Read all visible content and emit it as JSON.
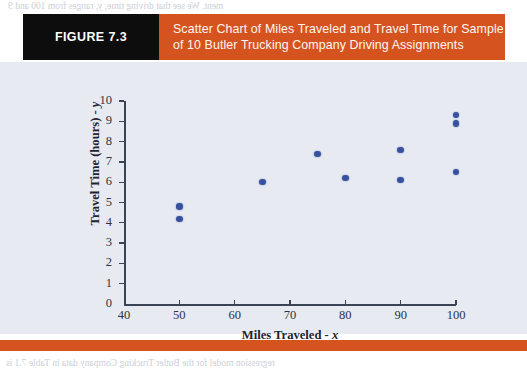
{
  "figure": {
    "tag": "FIGURE 7.3",
    "title_line1": "Scatter Chart of Miles Traveled and Travel Time for Sample",
    "title_line2": "of 10 Butler Trucking Company Driving Assignments",
    "tag_bg": "#0d0d0d",
    "banner_bg": "#d5531f",
    "panel_bg": "#e7eaf0",
    "marker_color": "#37519e",
    "axis_color": "#3b4454"
  },
  "chart_data": {
    "type": "scatter",
    "title": "Scatter Chart of Miles Traveled and Travel Time for Sample of 10 Butler Trucking Company Driving Assignments",
    "xlabel": "Miles Traveled - x",
    "ylabel": "Travel Time (hours) - y",
    "xlim": [
      40,
      100
    ],
    "ylim": [
      0,
      10
    ],
    "xticks": [
      40,
      50,
      60,
      70,
      80,
      90,
      100
    ],
    "yticks": [
      0,
      1,
      2,
      3,
      4,
      5,
      6,
      7,
      8,
      9,
      10
    ],
    "grid": false,
    "legend": "none",
    "n_points": 10,
    "marker": "filled-circle",
    "points": [
      {
        "x": 50,
        "y": 4.2
      },
      {
        "x": 50,
        "y": 4.8
      },
      {
        "x": 65,
        "y": 6.0
      },
      {
        "x": 75,
        "y": 7.4
      },
      {
        "x": 80,
        "y": 6.2
      },
      {
        "x": 90,
        "y": 6.1
      },
      {
        "x": 90,
        "y": 7.6
      },
      {
        "x": 100,
        "y": 6.5
      },
      {
        "x": 100,
        "y": 8.9
      },
      {
        "x": 100,
        "y": 9.3
      }
    ],
    "x": [
      50,
      50,
      65,
      75,
      80,
      90,
      90,
      100,
      100,
      100
    ],
    "values": [
      4.2,
      4.8,
      6.0,
      7.4,
      6.2,
      6.1,
      7.6,
      6.5,
      8.9,
      9.3
    ]
  },
  "bleed_text": {
    "top": "ment. We see that driving time, y, ranges from 100 and 9",
    "l1": "e 7.4           Figure 7.3 is a scatter chart of the data in Table 7.1. Miles tra",
    "l2": "is on the horizontal axis and travel time (in hours) is shown on the vert",
    "l3": "axis. For driving assignment 1, x = 100 miles and y = 9.3 hours. For dri",
    "l4": "assignment 2, x = 50 miles and y = 4.8 hours. Note that the greatest dri",
    "l5": "time corresponds to the longest distance travelled.",
    "r1": "regression analysis are concerned with the i",
    "r2": "and the dependent variable y on the vertical",
    "r3": "45; thus respective used in these preliminar",
    "r4": "before we consider.",
    "r5": "Two preliminary conclusions can be drawn",
    "r6": "appears to coincide with range miles traveled",
    "r7": "between the travel time and a miles traveled",
    "r8": "indeed, a positive linear relationship is indic",
    "r9": "the simple linear regression model to appro",
    "r10": "best task is to use the sample data in Table",
    "r11": "estimated simple linear regression equation",
    "r12": "regression equation (plus 7.11).",
    "bottom": "regression model for the Butler Trucking Company data in Table 7.1 is"
  }
}
